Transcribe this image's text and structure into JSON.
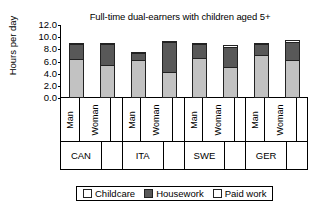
{
  "chart_data": {
    "type": "bar",
    "subtype": "stacked",
    "title": "Full-time dual-earners with children aged 5+",
    "xlabel": "",
    "ylabel": "Hours per day",
    "ylim": [
      0,
      12
    ],
    "yticks": [
      "0.0",
      "2.0",
      "4.0",
      "6.0",
      "8.0",
      "10.0",
      "12.0"
    ],
    "ytick_values": [
      0,
      2,
      4,
      6,
      8,
      10,
      12
    ],
    "grid": false,
    "legend_position": "bottom",
    "groups": [
      "CAN",
      "ITA",
      "SWE",
      "GER"
    ],
    "subcategories": [
      "Man",
      "Woman"
    ],
    "categories": [
      "CAN Man",
      "CAN Woman",
      "ITA Man",
      "ITA Woman",
      "SWE Man",
      "SWE Woman",
      "GER Man",
      "GER Woman"
    ],
    "series": [
      {
        "name": "Paid work",
        "color": "#c2c2c2",
        "values": [
          6.4,
          5.4,
          6.3,
          4.2,
          6.6,
          5.1,
          7.0,
          6.2
        ]
      },
      {
        "name": "Housework",
        "color": "#585858",
        "values": [
          2.7,
          3.6,
          1.2,
          5.1,
          2.5,
          3.5,
          2.1,
          3.1
        ]
      },
      {
        "name": "Childcare",
        "color": "#ffffff",
        "values": [
          0.3,
          0.4,
          0.1,
          0.4,
          0.2,
          0.5,
          0.2,
          0.5
        ]
      }
    ],
    "totals": [
      9.4,
      9.4,
      7.6,
      9.7,
      9.3,
      9.1,
      9.3,
      9.8
    ]
  },
  "legend": {
    "items": [
      {
        "label": "Childcare",
        "swatch": "childcare-swatch"
      },
      {
        "label": "Housework",
        "swatch": "housework-swatch"
      },
      {
        "label": "Paid work",
        "swatch": "paid-work-swatch"
      }
    ]
  }
}
